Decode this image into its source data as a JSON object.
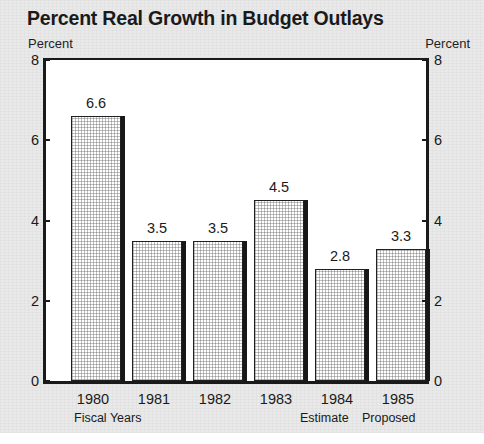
{
  "chart_data": {
    "type": "bar",
    "title": "Percent Real Growth in Budget Outlays",
    "xlabel": "Fiscal Years",
    "ylabel": "Percent",
    "ylabel_right": "Percent",
    "categories": [
      "1980",
      "1981",
      "1982",
      "1983",
      "1984",
      "1985"
    ],
    "values": [
      6.6,
      3.5,
      3.5,
      4.5,
      2.8,
      3.3
    ],
    "value_labels": [
      "6.6",
      "3.5",
      "3.5",
      "4.5",
      "2.8",
      "3.3"
    ],
    "category_notes": [
      "",
      "",
      "",
      "",
      "Estimate",
      "Proposed"
    ],
    "ylim": [
      0,
      8
    ],
    "yticks": [
      0,
      2,
      4,
      6,
      8
    ],
    "ytick_labels": [
      "0",
      "2",
      "4",
      "6",
      "8"
    ],
    "grid": false,
    "legend": "none",
    "dual_axis": true,
    "series_color": "#ffffff",
    "bar_edge_color": "#202020",
    "shadow_color": "#181818",
    "background_color": "#e9e9e9",
    "plot_background_color": "#ffffff"
  },
  "axis_notes": {
    "fiscal_years_note": "Fiscal Years",
    "estimate_note": "Estimate",
    "proposed_note": "Proposed"
  }
}
